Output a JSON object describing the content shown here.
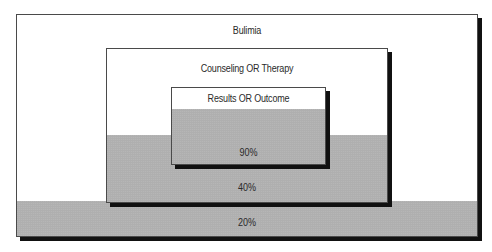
{
  "diagram": {
    "type": "nested-venn-boxes",
    "levels": [
      {
        "label": "Bulimia",
        "percent": "20%"
      },
      {
        "label": "Counseling OR Therapy",
        "percent": "40%"
      },
      {
        "label": "Results OR Outcome",
        "percent": "90%"
      }
    ]
  },
  "colors": {
    "box_fill": "#ffffff",
    "box_border": "#4a4a4a",
    "shadow": "#111111",
    "shade_fill": "#bdbdbd"
  }
}
